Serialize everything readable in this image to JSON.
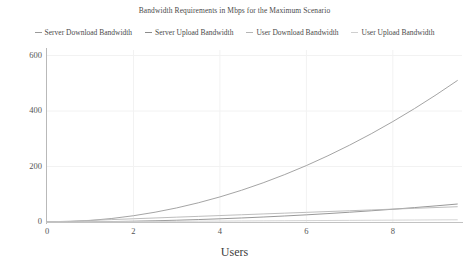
{
  "chart_data": {
    "type": "line",
    "title": "Bandwidth Requirements in Mbps for the Maximum Scenario",
    "xlabel": "Users",
    "ylabel": "",
    "xlim": [
      0,
      9.6
    ],
    "ylim": [
      0,
      620
    ],
    "grid": true,
    "legend_position": "top-center",
    "xticks": [
      "0",
      "2",
      "4",
      "6",
      "8"
    ],
    "xtick_values": [
      0,
      2,
      4,
      6,
      8
    ],
    "yticks": [
      "0",
      "200",
      "400",
      "600"
    ],
    "ytick_values": [
      0,
      200,
      400,
      600
    ],
    "x": [
      0,
      0.5,
      1,
      1.5,
      2,
      2.5,
      3,
      3.5,
      4,
      4.5,
      5,
      5.5,
      6,
      6.5,
      7,
      7.5,
      8,
      8.5,
      9,
      9.5
    ],
    "series": [
      {
        "name": "Server Download Bandwidth",
        "color": "#9a9a9a",
        "values": [
          0,
          1.4,
          5.6,
          12.7,
          22.6,
          35.3,
          50.8,
          69.2,
          90.4,
          114.4,
          141.3,
          171.0,
          203.5,
          238.9,
          277.1,
          318.1,
          362.0,
          408.7,
          458.3,
          510.7
        ]
      },
      {
        "name": "Server Upload Bandwidth",
        "color": "#8c8c8c",
        "values": [
          0,
          0.2,
          0.7,
          1.6,
          2.9,
          4.5,
          6.4,
          8.8,
          11.5,
          14.5,
          17.9,
          21.7,
          25.8,
          30.3,
          35.2,
          40.4,
          46.0,
          51.9,
          58.2,
          64.9
        ]
      },
      {
        "name": "User Download Bandwidth",
        "color": "#b5b5b5",
        "values": [
          0,
          2.9,
          5.8,
          8.7,
          11.6,
          14.5,
          17.4,
          20.3,
          23.2,
          26.1,
          29.0,
          31.9,
          34.8,
          37.7,
          40.6,
          43.5,
          46.4,
          49.3,
          52.2,
          55.1
        ]
      },
      {
        "name": "User Upload Bandwidth",
        "color": "#cfcfcf",
        "values": [
          0,
          0.42,
          0.84,
          1.26,
          1.68,
          2.1,
          2.52,
          2.94,
          3.36,
          3.78,
          4.2,
          4.62,
          5.04,
          5.46,
          5.88,
          6.3,
          6.72,
          7.14,
          7.56,
          7.98
        ]
      }
    ]
  }
}
